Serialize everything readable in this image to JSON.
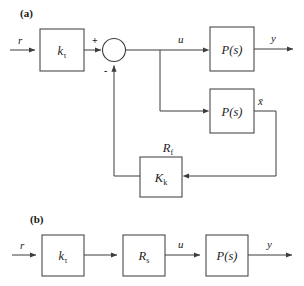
{
  "figure": {
    "panels": [
      {
        "id": "a",
        "label": "(a)",
        "blocks": [
          {
            "name": "gain-ktau",
            "base": "k",
            "sub": "τ"
          },
          {
            "name": "plant-top",
            "base": "P(s)",
            "sub": ""
          },
          {
            "name": "plant-model",
            "base": "P(s)",
            "sub": ""
          },
          {
            "name": "controller-kk",
            "base": "K",
            "sub": "k"
          }
        ],
        "signals": [
          {
            "name": "reference",
            "text": "r"
          },
          {
            "name": "control",
            "text": "u"
          },
          {
            "name": "output",
            "text": "y"
          },
          {
            "name": "state-estimate",
            "text": "x̄"
          }
        ],
        "annotations": [
          {
            "name": "feedback-path-label",
            "base": "R",
            "sub": "f"
          }
        ],
        "summing_junction": {
          "name": "summing-junction",
          "plus": "+",
          "minus": "-"
        }
      },
      {
        "id": "b",
        "label": "(b)",
        "blocks": [
          {
            "name": "gain-ktau",
            "base": "k",
            "sub": "τ"
          },
          {
            "name": "compensator-rs",
            "base": "R",
            "sub": "s"
          },
          {
            "name": "plant",
            "base": "P(s)",
            "sub": ""
          }
        ],
        "signals": [
          {
            "name": "reference",
            "text": "r"
          },
          {
            "name": "control",
            "text": "u"
          },
          {
            "name": "output",
            "text": "y"
          }
        ]
      }
    ],
    "colors": {
      "line": "#3d3d3d",
      "box_stroke": "#4a4a4a",
      "text": "#1a1a1a",
      "background": "#ffffff"
    }
  }
}
